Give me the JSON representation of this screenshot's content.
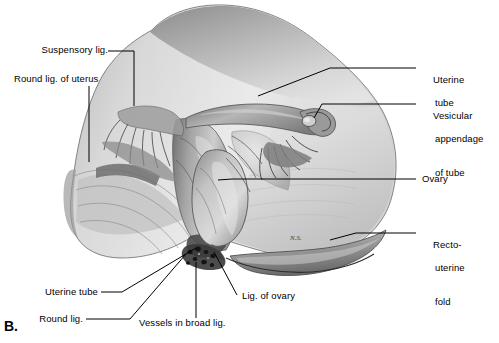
{
  "figure": {
    "panel_label": "B.",
    "signature": "N.S.",
    "line_color": "#000000",
    "background_color": "#ffffff"
  },
  "labels_left": [
    {
      "id": "suspensory-lig",
      "text": "Suspensory lig."
    },
    {
      "id": "round-lig-of-uterus",
      "text": "Round lig. of uterus"
    },
    {
      "id": "uterine-tube-left",
      "text": "Uterine tube"
    },
    {
      "id": "round-lig",
      "text": "Round lig."
    }
  ],
  "labels_right": [
    {
      "id": "uterine-tube-right",
      "line1": "Uterine",
      "line2": "tube",
      "line3": ""
    },
    {
      "id": "vesicular-appendage",
      "line1": "Vesicular",
      "line2": "appendage",
      "line3": "of tube"
    },
    {
      "id": "ovary",
      "line1": "Ovary",
      "line2": "",
      "line3": ""
    },
    {
      "id": "recto-uterine-fold",
      "line1": "Recto-",
      "line2": "uterine",
      "line3": "fold"
    }
  ],
  "labels_bottom": [
    {
      "id": "lig-of-ovary",
      "text": "Lig. of ovary"
    },
    {
      "id": "vessels-in-broad-lig",
      "text": "Vessels in broad lig."
    }
  ]
}
